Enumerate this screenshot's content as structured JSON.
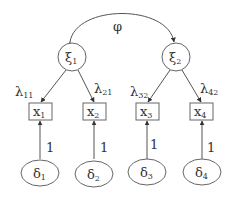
{
  "diagram": {
    "type": "confirmatory factor analysis path diagram",
    "covariance": {
      "label": "φ",
      "from": "xi1",
      "to": "xi2"
    },
    "latent_factors": [
      {
        "id": "xi1",
        "symbol": "ξ",
        "subscript": "1"
      },
      {
        "id": "xi2",
        "symbol": "ξ",
        "subscript": "2"
      }
    ],
    "indicators": [
      {
        "id": "x1",
        "symbol": "x",
        "subscript": "1",
        "factor": "xi1",
        "loading": {
          "symbol": "λ",
          "subscript": "11"
        }
      },
      {
        "id": "x2",
        "symbol": "x",
        "subscript": "2",
        "factor": "xi1",
        "loading": {
          "symbol": "λ",
          "subscript": "21"
        }
      },
      {
        "id": "x3",
        "symbol": "x",
        "subscript": "3",
        "factor": "xi2",
        "loading": {
          "symbol": "λ",
          "subscript": "32"
        }
      },
      {
        "id": "x4",
        "symbol": "x",
        "subscript": "4",
        "factor": "xi2",
        "loading": {
          "symbol": "λ",
          "subscript": "42"
        }
      }
    ],
    "errors": [
      {
        "id": "d1",
        "symbol": "δ",
        "subscript": "1",
        "target": "x1",
        "weight": "1"
      },
      {
        "id": "d2",
        "symbol": "δ",
        "subscript": "2",
        "target": "x2",
        "weight": "1"
      },
      {
        "id": "d3",
        "symbol": "δ",
        "subscript": "3",
        "target": "x3",
        "weight": "1"
      },
      {
        "id": "d4",
        "symbol": "δ",
        "subscript": "4",
        "target": "x4",
        "weight": "1"
      }
    ]
  }
}
